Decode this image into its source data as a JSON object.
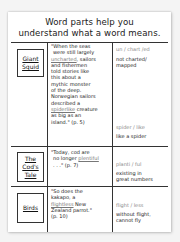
{
  "title": {
    "line1": "Word parts help you",
    "line2": "understand what a word means."
  },
  "rows": [
    {
      "label": [
        "Giant",
        "Squid"
      ],
      "quote": {
        "l1": "\"When the seas",
        "l2": "were still largely",
        "l3_u": "uncharted",
        "l3_rest": ", sailors",
        "l4": "and fishermen",
        "l5": "told stories like",
        "l6": "this about a",
        "l7": "mythic monster",
        "l8": "of the deep.",
        "l9": "Norwegian sailors",
        "l10": "described a",
        "l11_u": "spiderlike",
        "l11_rest": " creature",
        "l12": "as big as an",
        "l13": "island.\" (p. 5)"
      },
      "entries": [
        {
          "parts": "un / chart /ed",
          "meaning": [
            "not charted/",
            "mapped"
          ]
        },
        {
          "parts": "spider / like",
          "meaning": [
            "like a spider"
          ]
        }
      ]
    },
    {
      "label": [
        "The",
        "Cod's",
        "Tale"
      ],
      "quote": {
        "l1": "\"Today, cod are",
        "l2_pre": "no longer ",
        "l2_u": "plentiful",
        "l3": ". . .\" (p. 7)"
      },
      "entries": [
        {
          "parts": "planti / ful",
          "meaning": [
            "existing in",
            "great numbers"
          ]
        }
      ]
    },
    {
      "label": [
        "Birds"
      ],
      "quote": {
        "l1": "\"So does the",
        "l2": "kakapo, a",
        "l3_u": "flightless",
        "l3_rest": " New",
        "l4": "Zealand parrot.\"",
        "l5": "(p. 10)"
      },
      "entries": [
        {
          "parts": "flight / less",
          "meaning": [
            "without flight,",
            "cannot fly"
          ]
        }
      ]
    }
  ]
}
